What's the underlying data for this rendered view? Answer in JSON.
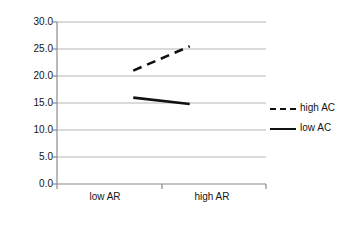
{
  "chart_data": {
    "type": "line",
    "title": "",
    "subtitle": "",
    "xlabel": "",
    "ylabel": "relative frequency (MAJ)",
    "categories": [
      "low AR",
      "high AR"
    ],
    "series": [
      {
        "name": "high AC",
        "values": [
          21.0,
          25.5
        ],
        "style": "dashed"
      },
      {
        "name": "low AC",
        "values": [
          16.0,
          14.8
        ],
        "style": "solid"
      }
    ],
    "ylim": [
      0.0,
      30.0
    ],
    "y_ticks": [
      "0.0",
      "5.0",
      "10.0",
      "15.0",
      "20.0",
      "25.0",
      "30.0"
    ],
    "y_tick_values": [
      0.0,
      5.0,
      10.0,
      15.0,
      20.0,
      25.0,
      30.0
    ],
    "grid": "horizontal",
    "legend_position": "right",
    "colors": {
      "line": "#111111",
      "grid": "#b5b5b5",
      "axis": "#8c8c8c"
    }
  },
  "legend": {
    "entries": [
      {
        "label": "high AC"
      },
      {
        "label": "low AC"
      }
    ]
  }
}
